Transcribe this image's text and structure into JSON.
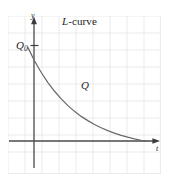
{
  "figure": {
    "title": "L-curve",
    "title_italic_prefix": "L",
    "title_rest": "-curve",
    "background_color": "#ffffff",
    "grid_color": "#e3e3e6",
    "axis_color": "#4a4a4a",
    "curve_color": "#6a6a6a",
    "text_color": "#1d1d1d"
  },
  "labels": {
    "y_axis": "y",
    "x_axis": "t",
    "origin_value": "Q",
    "origin_subscript": "0",
    "curve": "Q"
  },
  "chart_data": {
    "type": "line",
    "title": "L-curve",
    "xlabel": "t",
    "ylabel": "y",
    "grid": true,
    "legend": false,
    "annotations": [
      {
        "text": "Q",
        "role": "curve-label",
        "x": 3.45,
        "y": 2.15
      },
      {
        "text": "Q0",
        "role": "y-intercept-tick",
        "x": 0,
        "y": 5.5
      },
      {
        "text": "L-curve",
        "role": "title"
      }
    ],
    "xlim": [
      -1.2,
      8.0
    ],
    "ylim": [
      -1.3,
      7.2
    ],
    "x_tick_labels": [],
    "y_tick_labels": [
      "Q0"
    ],
    "series": [
      {
        "name": "Q",
        "description": "exponential decay from Q0 asymptotic to t-axis",
        "x": [
          0.0,
          0.4,
          0.8,
          1.2,
          1.6,
          2.0,
          2.4,
          2.8,
          3.2,
          3.6,
          4.0,
          4.4,
          4.8,
          5.2,
          5.6,
          6.0,
          6.4,
          6.8,
          7.2
        ],
        "y": [
          5.5,
          4.78,
          4.16,
          3.62,
          3.15,
          2.74,
          2.38,
          2.07,
          1.8,
          1.57,
          1.36,
          1.19,
          1.03,
          0.9,
          0.78,
          0.68,
          0.59,
          0.51,
          0.45
        ]
      }
    ]
  }
}
